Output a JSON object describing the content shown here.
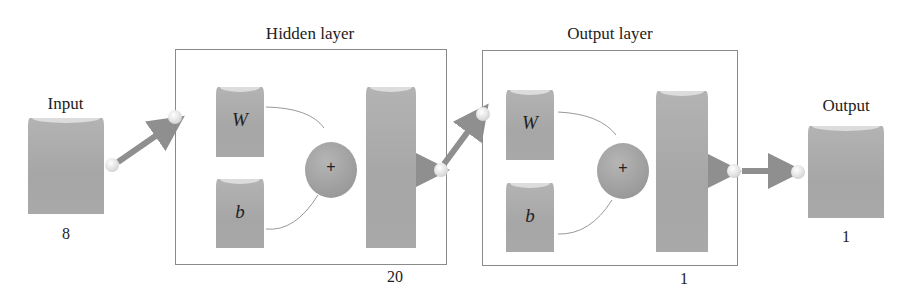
{
  "diagram": {
    "type": "neural-network-architecture",
    "input": {
      "label": "Input",
      "size": "8"
    },
    "hidden_layer": {
      "label": "Hidden layer",
      "size": "20",
      "weight": "W",
      "bias": "b",
      "sum_symbol": "+",
      "transfer": "sigmoid"
    },
    "output_layer": {
      "label": "Output layer",
      "size": "1",
      "weight": "W",
      "bias": "b",
      "sum_symbol": "+",
      "transfer": "linear"
    },
    "output": {
      "label": "Output",
      "size": "1"
    },
    "colors": {
      "block": "#a9a9a9",
      "border": "#8a8a8a",
      "arrow": "#8f8f8f",
      "text": "#222222"
    }
  }
}
